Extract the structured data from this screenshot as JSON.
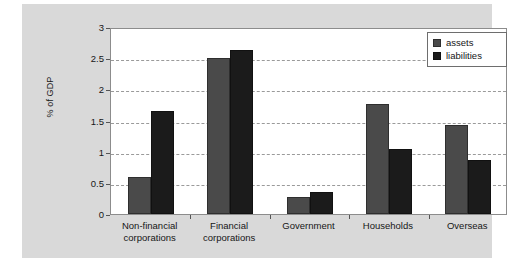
{
  "chart_data": {
    "type": "bar",
    "title": "",
    "xlabel": "",
    "ylabel": "% of GDP",
    "ylim": [
      0,
      3
    ],
    "yticks": [
      "0",
      "0.5",
      "1",
      "1.5",
      "2",
      "2.5",
      "3"
    ],
    "ytick_values": [
      0,
      0.5,
      1,
      1.5,
      2,
      2.5,
      3
    ],
    "grid": true,
    "legend_position": "top-right",
    "categories": [
      "Non-financial corporations",
      "Financial corporations",
      "Government",
      "Households",
      "Overseas"
    ],
    "category_lines": [
      [
        "Non-financial",
        "corporations"
      ],
      [
        "Financial",
        "corporations"
      ],
      [
        "Government"
      ],
      [
        "Households"
      ],
      [
        "Overseas"
      ]
    ],
    "series": [
      {
        "name": "assets",
        "color": "#4a4a4a",
        "values": [
          0.6,
          2.5,
          0.27,
          1.77,
          1.43
        ]
      },
      {
        "name": "liabilities",
        "color": "#1b1b1b",
        "values": [
          1.65,
          2.63,
          0.35,
          1.05,
          0.86
        ]
      }
    ]
  },
  "legend": {
    "items": [
      {
        "label": "assets"
      },
      {
        "label": "liabilities"
      }
    ]
  },
  "colors": {
    "assets": "#4a4a4a",
    "liabilities": "#1b1b1b",
    "panel_background": "#d9d9d9",
    "plot_background": "#ffffff",
    "gridline": "#9a9a9a",
    "axis": "#8c8c8c"
  }
}
